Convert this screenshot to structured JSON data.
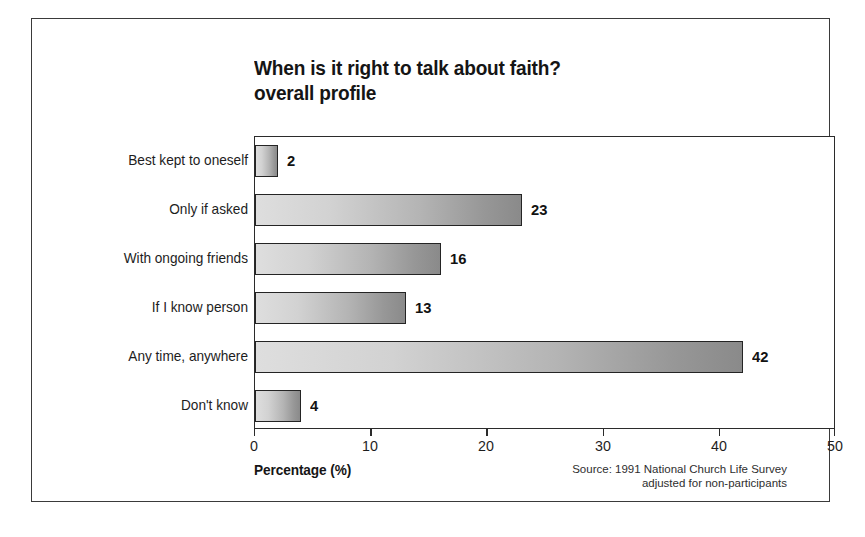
{
  "chart_data": {
    "type": "bar",
    "orientation": "horizontal",
    "title": "When is it right to talk about faith?",
    "subtitle": "overall profile",
    "categories": [
      "Best kept to oneself",
      "Only if asked",
      "With ongoing friends",
      "If I know person",
      "Any time, anywhere",
      "Don't know"
    ],
    "values": [
      2,
      23,
      16,
      13,
      42,
      4
    ],
    "value_labels": [
      "2",
      "23",
      "16",
      "13",
      "42",
      "4"
    ],
    "xlabel": "Percentage (%)",
    "ylabel": "",
    "xlim": [
      0,
      50
    ],
    "xticks": [
      0,
      10,
      20,
      30,
      40,
      50
    ],
    "xtick_labels": [
      "0",
      "10",
      "20",
      "30",
      "40",
      "50"
    ],
    "grid": false,
    "legend": false,
    "bar_fill_start": "#dedede",
    "bar_fill_end": "#8a8a8a",
    "bar_outline": "#242424",
    "axis_color": "#2b2b2b",
    "text_color": "#1a1a1a",
    "background": "#ffffff"
  },
  "source_note": {
    "line1": "Source: 1991 National Church Life Survey",
    "line2": "adjusted for non-participants"
  }
}
